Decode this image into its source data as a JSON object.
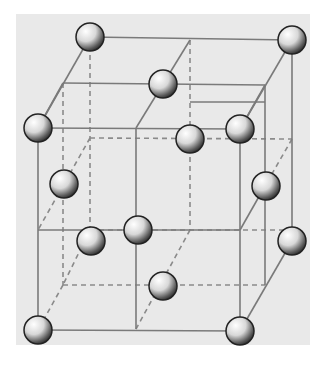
{
  "figure": {
    "type": "crystal-lattice-diagram",
    "colors": {
      "background": "#e9e9e9",
      "page": "#ffffff",
      "edge_solid": "#7a7a7a",
      "edge_hidden": "#8a8a8a",
      "sphere_outline": "#222222"
    },
    "solid_edges": [
      [
        90,
        37,
        292,
        40
      ],
      [
        90,
        37,
        38,
        128
      ],
      [
        292,
        40,
        240,
        129
      ],
      [
        38,
        128,
        240,
        129
      ],
      [
        190,
        102,
        265,
        102
      ],
      [
        63,
        83,
        265,
        85
      ],
      [
        63,
        83,
        38,
        128
      ],
      [
        190,
        40,
        136,
        128
      ],
      [
        265,
        85,
        240,
        129
      ],
      [
        38,
        128,
        38,
        330
      ],
      [
        240,
        129,
        240,
        331
      ],
      [
        136,
        128,
        136,
        329
      ],
      [
        292,
        40,
        292,
        241
      ],
      [
        265,
        85,
        265,
        285
      ],
      [
        38,
        230,
        240,
        230
      ],
      [
        240,
        230,
        265,
        186
      ],
      [
        38,
        330,
        240,
        331
      ],
      [
        292,
        241,
        240,
        331
      ]
    ],
    "hidden_edges": [
      [
        90,
        37,
        90,
        230
      ],
      [
        190,
        40,
        190,
        230
      ],
      [
        63,
        83,
        63,
        285
      ],
      [
        90,
        138,
        292,
        139
      ],
      [
        90,
        138,
        38,
        230
      ],
      [
        292,
        139,
        265,
        186
      ],
      [
        90,
        230,
        292,
        230
      ],
      [
        63,
        285,
        265,
        285
      ],
      [
        63,
        285,
        38,
        330
      ],
      [
        190,
        230,
        136,
        329
      ],
      [
        90,
        230,
        63,
        285
      ]
    ],
    "spheres": [
      {
        "cx": 90,
        "cy": 37
      },
      {
        "cx": 292,
        "cy": 40
      },
      {
        "cx": 163,
        "cy": 84
      },
      {
        "cx": 38,
        "cy": 128
      },
      {
        "cx": 240,
        "cy": 129
      },
      {
        "cx": 190,
        "cy": 139
      },
      {
        "cx": 64,
        "cy": 184
      },
      {
        "cx": 266,
        "cy": 186
      },
      {
        "cx": 138,
        "cy": 230
      },
      {
        "cx": 91,
        "cy": 241
      },
      {
        "cx": 292,
        "cy": 241
      },
      {
        "cx": 163,
        "cy": 286
      },
      {
        "cx": 38,
        "cy": 330
      },
      {
        "cx": 240,
        "cy": 331
      }
    ],
    "sphere_radius": 14
  }
}
